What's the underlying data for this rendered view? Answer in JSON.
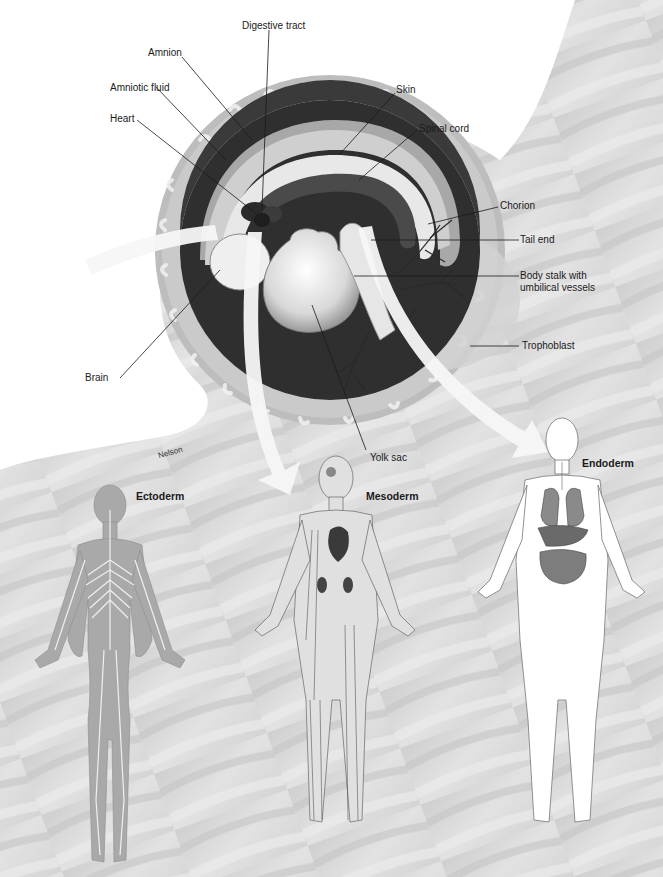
{
  "figure": {
    "signature": "Nelson",
    "embryo_labels": {
      "digestive_tract": "Digestive tract",
      "amnion": "Amnion",
      "skin": "Skin",
      "amniotic_fluid": "Amniotic fluid",
      "spinal_cord": "Spinal cord",
      "heart": "Heart",
      "chorion": "Chorion",
      "tail_end": "Tail end",
      "body_stalk": "Body stalk with",
      "body_stalk_line2": "umbilical vessels",
      "trophoblast": "Trophoblast",
      "brain": "Brain",
      "yolk_sac": "Yolk sac"
    },
    "germ_layers": [
      {
        "id": "ectoderm",
        "label": "Ectoderm",
        "depicts": "nervous system (brain, spinal cord, nerves)"
      },
      {
        "id": "mesoderm",
        "label": "Mesoderm",
        "depicts": "muscles, skeleton, heart, kidneys, blood vessels"
      },
      {
        "id": "endoderm",
        "label": "Endoderm",
        "depicts": "lungs, liver, stomach, intestines, bladder"
      }
    ],
    "colors": {
      "background_texture": "#d9d9d9",
      "uterine_wall": "#c8c8c8",
      "amnion_dark": "#2e2e2e",
      "arrow": "#f7f7f7",
      "ectoderm_body": "#a9a9a9",
      "endoderm_body": "#ffffff"
    }
  }
}
